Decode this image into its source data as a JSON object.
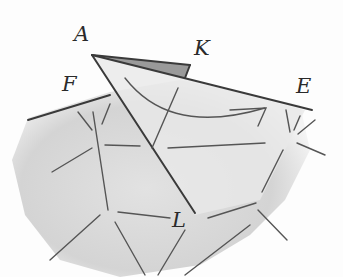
{
  "diagram": {
    "labels": [
      {
        "id": "A",
        "text": "A",
        "x": 74,
        "y": 24
      },
      {
        "id": "K",
        "text": "K",
        "x": 194,
        "y": 38
      },
      {
        "id": "F",
        "text": "F",
        "x": 62,
        "y": 74
      },
      {
        "id": "E",
        "text": "E",
        "x": 296,
        "y": 76
      },
      {
        "id": "L",
        "text": "L",
        "x": 172,
        "y": 210
      }
    ],
    "colors": {
      "ink": "#3a3a3a",
      "surface_shade": "#d6d6d6",
      "flap_shade": "#e6e6e6",
      "flap_dark": "#9a9a9a"
    }
  }
}
